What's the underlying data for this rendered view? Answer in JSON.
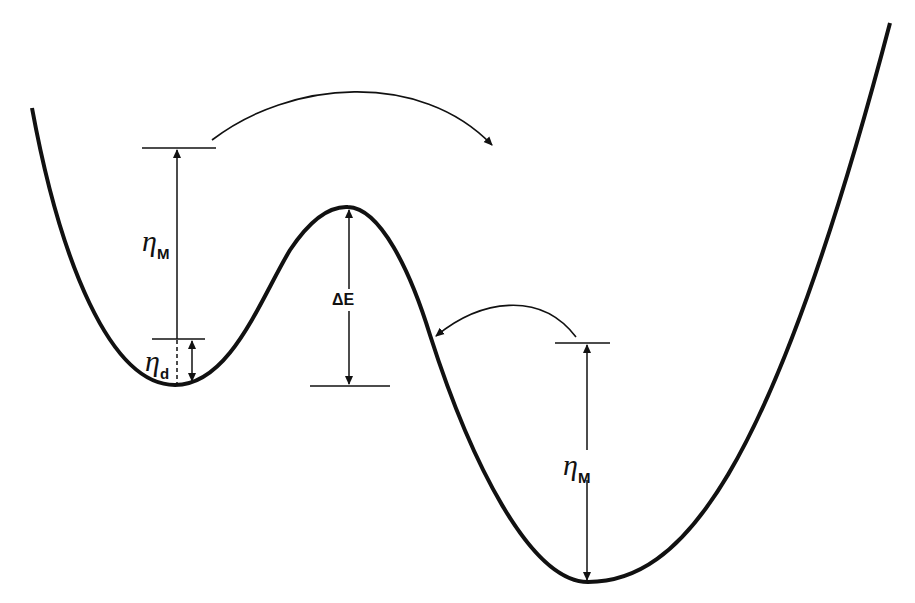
{
  "diagram": {
    "type": "double-well energy potential",
    "stroke_color": "#111111",
    "background": "#ffffff",
    "labels": {
      "eta_M_left": {
        "symbol": "η",
        "subscript": "M"
      },
      "eta_d": {
        "symbol": "η",
        "subscript": "d"
      },
      "delta_E": "ΔE",
      "eta_M_right": {
        "symbol": "η",
        "subscript": "M"
      }
    },
    "arrows": [
      {
        "name": "transition-left-to-right",
        "description": "curved arrow from upper left level toward right well"
      },
      {
        "name": "transition-right-to-left",
        "description": "curved arrow from right level back to barrier slope"
      }
    ]
  }
}
